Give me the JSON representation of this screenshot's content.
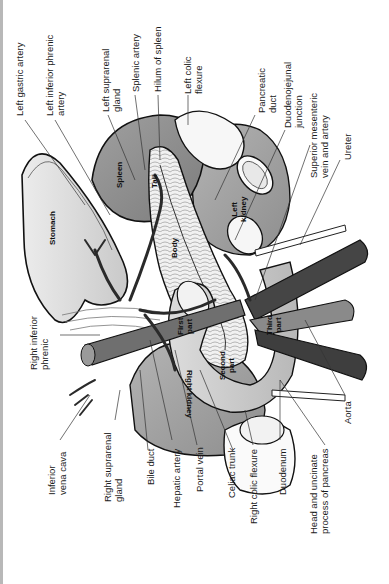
{
  "figure": {
    "orientation": "rotated 90 degrees counter-clockwise"
  },
  "labels_top": [
    {
      "id": "left-gastric-artery",
      "lines": [
        "Left gastric artery"
      ]
    },
    {
      "id": "left-inferior-phrenic-artery",
      "lines": [
        "Left inferior phrenic",
        "artery"
      ]
    },
    {
      "id": "left-suprarenal-gland",
      "lines": [
        "Left suprarenal",
        "gland"
      ]
    },
    {
      "id": "splenic-artery",
      "lines": [
        "Splenic artery"
      ]
    },
    {
      "id": "hilum-of-spleen",
      "lines": [
        "Hilum of spleen"
      ]
    },
    {
      "id": "left-colic-flexure",
      "lines": [
        "Left colic",
        "flexure"
      ]
    },
    {
      "id": "pancreatic-duct",
      "lines": [
        "Pancreatic",
        "duct"
      ]
    },
    {
      "id": "duodenojejunal-junction",
      "lines": [
        "Duodenojejunal",
        "junction"
      ]
    },
    {
      "id": "superior-mesenteric-vein-and-artery",
      "lines": [
        "Superior mesenteric",
        "vein and artery"
      ]
    },
    {
      "id": "ureter",
      "lines": [
        "Ureter"
      ]
    }
  ],
  "labels_left": [
    {
      "id": "right-inferior-phrenic",
      "lines": [
        "Right inferior",
        "phrenic"
      ]
    }
  ],
  "labels_bottom": [
    {
      "id": "inferior-vena-cava",
      "lines": [
        "Inferior",
        "vena cava"
      ]
    },
    {
      "id": "right-suprarenal-gland",
      "lines": [
        "Right suprarenal",
        "gland"
      ]
    },
    {
      "id": "bile-duct",
      "lines": [
        "Bile duct"
      ]
    },
    {
      "id": "hepatic-artery",
      "lines": [
        "Hepatic artery"
      ]
    },
    {
      "id": "portal-vein",
      "lines": [
        "Portal vein"
      ]
    },
    {
      "id": "celiac-trunk",
      "lines": [
        "Celiac trunk"
      ]
    },
    {
      "id": "right-colic-flexure",
      "lines": [
        "Right colic flexure"
      ]
    },
    {
      "id": "duodenum",
      "lines": [
        "Duodenum"
      ]
    },
    {
      "id": "head-and-uncinate-process",
      "lines": [
        "Head and uncinate",
        "process of pancreas"
      ]
    },
    {
      "id": "aorta",
      "lines": [
        "Aorta"
      ]
    }
  ],
  "organ_labels": {
    "stomach": "Stomach",
    "spleen": "Spleen",
    "tail": "Tail",
    "body": "Body",
    "left_kidney": [
      "Left",
      "kidney"
    ],
    "right_kidney": "Right kidney",
    "first_part": [
      "First",
      "part"
    ],
    "second_part": [
      "Second",
      "part"
    ],
    "third_part": [
      "Third",
      "part"
    ]
  },
  "colors": {
    "background": "#ffffff",
    "border": "#b8b8b8",
    "organ_light": "#d9d9d9",
    "organ_mid": "#9a9a9a",
    "vessel_dark": "#3a3a3a",
    "outline": "#111111",
    "leader_line": "#333333"
  }
}
